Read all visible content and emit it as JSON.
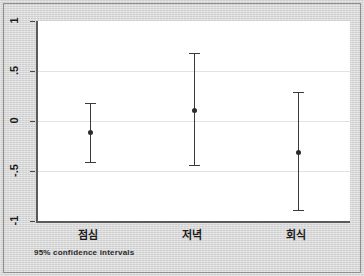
{
  "chart_data": {
    "type": "scatter",
    "title": "",
    "subtitle": "",
    "xlabel": "",
    "ylabel": "",
    "caption": "95% confidence intervals",
    "grid": true,
    "legend": "none",
    "ylim": [
      -1,
      1
    ],
    "yticks": [
      1,
      0.5,
      0,
      -0.5,
      -1
    ],
    "ytick_labels": [
      "1",
      ".5",
      "0",
      "-.5",
      "-1"
    ],
    "categories": [
      "점심",
      "저녁",
      "회식"
    ],
    "series": [
      {
        "name": "mean with 95% CI",
        "points": [
          {
            "category": "점심",
            "value": -0.11,
            "ci_low": -0.41,
            "ci_high": 0.18
          },
          {
            "category": "저녁",
            "value": 0.11,
            "ci_low": -0.44,
            "ci_high": 0.68
          },
          {
            "category": "회식",
            "value": -0.31,
            "ci_low": -0.89,
            "ci_high": 0.29
          }
        ]
      }
    ]
  }
}
